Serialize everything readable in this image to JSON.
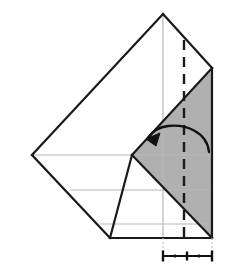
{
  "figure": {
    "kind": "origami-fold-diagram",
    "title": "",
    "caption": "",
    "background_color": "#ffffff",
    "canvas": {
      "width": 232,
      "height": 269
    }
  },
  "style": {
    "paper_front_color": "#ffffff",
    "paper_back_color": "#b0b0b0",
    "outline_color": "#1a1a1a",
    "outline_width": 2.2,
    "crease_line_color": "#b8b8b8",
    "crease_line_width": 1.2,
    "fold_line_color": "#1a1a1a",
    "fold_line_width": 2.4,
    "fold_line_dash": "10,7",
    "arrow_color": "#111111",
    "arrow_width": 2.4,
    "ruler_color": "#111111",
    "ruler_width": 2.0,
    "guide_color": "#c9c9c9"
  },
  "geometry": {
    "apex_top": {
      "x": 163,
      "y": 14
    },
    "left_vertex": {
      "x": 32,
      "y": 155
    },
    "bottom_vertex": {
      "x": 110,
      "y": 238
    },
    "right_top_corner": {
      "x": 212,
      "y": 68
    },
    "right_bottom_corner": {
      "x": 212,
      "y": 238
    },
    "notch_vertex": {
      "x": 132,
      "y": 155
    },
    "mid_right_vertex": {
      "x": 212,
      "y": 155
    },
    "inner_diagonal_start": {
      "x": 132,
      "y": 155
    },
    "inner_diagonal_end": {
      "x": 212,
      "y": 238
    },
    "bottom_edge_left": {
      "x": 110,
      "y": 238
    },
    "bottom_edge_right": {
      "x": 212,
      "y": 238
    }
  },
  "shapes": {
    "white_front_label": "white-paper-front",
    "gray_back_upper_label": "gray-paper-back-upper",
    "gray_back_lower_label": "gray-paper-back-lower"
  },
  "crease_lines": [
    {
      "name": "horizontal-crease-mid",
      "x1": 32,
      "y1": 155,
      "x2": 212,
      "y2": 155
    },
    {
      "name": "horizontal-crease-lower",
      "x1": 70,
      "y1": 190,
      "x2": 212,
      "y2": 190
    },
    {
      "name": "horizontal-crease-bottom",
      "x1": 100,
      "y1": 224,
      "x2": 212,
      "y2": 224
    },
    {
      "name": "vertical-crease-center",
      "x1": 163,
      "y1": 14,
      "x2": 163,
      "y2": 238
    }
  ],
  "fold_line": {
    "name": "valley-fold-dashed-line",
    "x": 184,
    "y1": 40,
    "y2": 238,
    "description": "vertical dashed fold line"
  },
  "arrow": {
    "name": "fold-direction-arrow",
    "description": "curved arrow pointing left indicating fold direction",
    "path": "M 209 152 C 207 132 186 124 168 126 C 158 127 152 132 148 138",
    "head": "M 148 138 L 159 134 L 155 145 Z",
    "direction": "left"
  },
  "ruler": {
    "name": "measurement-scale",
    "baseline_y": 256,
    "start_x": 163,
    "end_x": 212,
    "end_cap_height": 11,
    "mid_tick_height": 9,
    "minor_tick_height": 3,
    "major_ticks_x": [
      163,
      187,
      212
    ],
    "minor_ticks_x": [
      175,
      199
    ],
    "labels": []
  },
  "guides": [
    {
      "name": "guide-left",
      "x": 163,
      "y1": 238,
      "y2": 252
    },
    {
      "name": "guide-right",
      "x": 212,
      "y1": 238,
      "y2": 252
    }
  ]
}
